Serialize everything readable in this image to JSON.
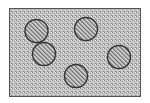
{
  "diagram": {
    "container": {
      "shape": "rectangle",
      "x": 9,
      "y": 8,
      "width": 131,
      "height": 88,
      "fill_pattern": "stipple",
      "fill_color": "#c4c4c4",
      "dot_color": "#8a8a8a",
      "border_color": "#555555"
    },
    "inclusions": [
      {
        "id": 1,
        "shape": "circle",
        "cx": 36.5,
        "cy": 31,
        "r": 11.5
      },
      {
        "id": 2,
        "shape": "circle",
        "cx": 86,
        "cy": 29,
        "r": 11.5
      },
      {
        "id": 3,
        "shape": "circle",
        "cx": 44,
        "cy": 54,
        "r": 11.5
      },
      {
        "id": 4,
        "shape": "circle",
        "cx": 119,
        "cy": 57,
        "r": 11.5
      },
      {
        "id": 5,
        "shape": "circle",
        "cx": 76,
        "cy": 76,
        "r": 11.5
      }
    ],
    "inclusion_style": {
      "fill_pattern": "diagonal-hatch",
      "hatch_bg": "#d8d8d8",
      "hatch_line": "#6a6a6a",
      "outline_color": "#333333"
    }
  }
}
